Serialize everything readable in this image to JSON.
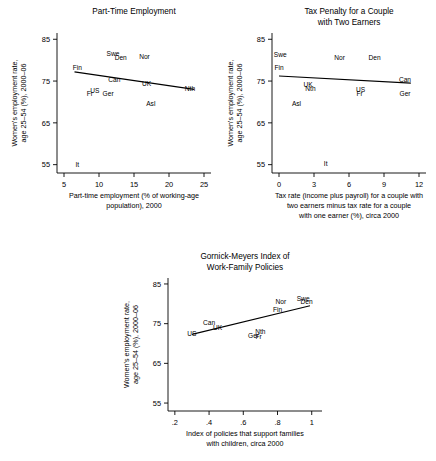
{
  "figure": {
    "shared_ylabel_line1": "Women's employment rate,",
    "shared_ylabel_line2": "age 25–54 (%), 2000–06"
  },
  "chart_data": [
    {
      "id": "part-time-employment",
      "type": "scatter",
      "title_lines": [
        "Part-Time Employment"
      ],
      "xlabel_lines": [
        "Part-time employment (% of working-age",
        "population), 2000"
      ],
      "ylabel_lines": [
        "Women's employment rate,",
        "age 25–54 (%), 2000–06"
      ],
      "xlim": [
        4.0,
        26.0
      ],
      "ylim": [
        53.0,
        86.5
      ],
      "xticks": [
        5,
        10,
        15,
        20,
        25
      ],
      "xticklabels": [
        "5",
        "10",
        "15",
        "20",
        "25"
      ],
      "yticks": [
        55,
        65,
        75,
        85
      ],
      "yticklabels": [
        "55",
        "65",
        "75",
        "85"
      ],
      "grid": false,
      "legend": "none",
      "points": [
        {
          "label": "Fin",
          "x": 6.9,
          "y": 78.3
        },
        {
          "label": "Swe",
          "x": 12.0,
          "y": 81.5
        },
        {
          "label": "Den",
          "x": 13.1,
          "y": 80.6
        },
        {
          "label": "Nor",
          "x": 16.5,
          "y": 80.8
        },
        {
          "label": "Can",
          "x": 12.2,
          "y": 75.4
        },
        {
          "label": "UK",
          "x": 16.8,
          "y": 74.3
        },
        {
          "label": "Nth",
          "x": 23.0,
          "y": 73.1
        },
        {
          "label": "US",
          "x": 9.4,
          "y": 72.7
        },
        {
          "label": "Fr",
          "x": 8.7,
          "y": 71.9
        },
        {
          "label": "Ger",
          "x": 11.3,
          "y": 72.0
        },
        {
          "label": "Asl",
          "x": 17.4,
          "y": 69.6
        },
        {
          "label": "It",
          "x": 6.9,
          "y": 55.1
        }
      ],
      "fitline": {
        "x1": 6.5,
        "y1": 77.2,
        "x2": 23.6,
        "y2": 73.0
      }
    },
    {
      "id": "tax-penalty-two-earners",
      "type": "scatter",
      "title_lines": [
        "Tax Penalty for a Couple",
        "with Two Earners"
      ],
      "xlabel_lines": [
        "Tax rate (income plus payroll) for a couple with",
        "two earners minus tax rate for a couple",
        "with one earner (%), circa 2000"
      ],
      "ylabel_lines": [
        "Women's employment rate,",
        "age 25–54 (%), 2000–06"
      ],
      "xlim": [
        -0.6,
        12.6
      ],
      "ylim": [
        53.0,
        86.5
      ],
      "xticks": [
        0,
        3,
        6,
        9,
        12
      ],
      "xticklabels": [
        "0",
        "3",
        "6",
        "9",
        "12"
      ],
      "yticks": [
        55,
        65,
        75,
        85
      ],
      "yticklabels": [
        "55",
        "65",
        "75",
        "85"
      ],
      "grid": false,
      "legend": "none",
      "points": [
        {
          "label": "Swe",
          "x": 0.1,
          "y": 81.4
        },
        {
          "label": "Fin",
          "x": 0.0,
          "y": 78.3
        },
        {
          "label": "Nor",
          "x": 5.2,
          "y": 80.6
        },
        {
          "label": "Den",
          "x": 8.2,
          "y": 80.7
        },
        {
          "label": "Can",
          "x": 10.8,
          "y": 75.4
        },
        {
          "label": "UK",
          "x": 2.5,
          "y": 74.1
        },
        {
          "label": "Nth",
          "x": 2.7,
          "y": 73.1
        },
        {
          "label": "US",
          "x": 7.0,
          "y": 73.0
        },
        {
          "label": "Fr",
          "x": 6.9,
          "y": 71.9
        },
        {
          "label": "Ger",
          "x": 10.8,
          "y": 72.0
        },
        {
          "label": "Asl",
          "x": 1.5,
          "y": 69.5
        },
        {
          "label": "It",
          "x": 4.0,
          "y": 55.2
        }
      ],
      "fitline": {
        "x1": 0.0,
        "y1": 76.2,
        "x2": 11.3,
        "y2": 74.5
      }
    },
    {
      "id": "gornick-meyers-index",
      "type": "scatter",
      "title_lines": [
        "Gornick-Meyers Index of",
        "Work-Family Policies"
      ],
      "xlabel_lines": [
        "Index of policies that support families",
        "with children, circa 2000"
      ],
      "ylabel_lines": [
        "Women's employment rate,",
        "age 25–54 (%), 2000–06"
      ],
      "xlim": [
        0.16,
        1.06
      ],
      "ylim": [
        53.0,
        86.5
      ],
      "xticks": [
        0.2,
        0.4,
        0.6,
        0.8,
        1.0
      ],
      "xticklabels": [
        ".2",
        ".4",
        ".6",
        ".8",
        "1"
      ],
      "yticks": [
        55,
        65,
        75,
        85
      ],
      "yticklabels": [
        "55",
        "65",
        "75",
        "85"
      ],
      "grid": false,
      "legend": "none",
      "points": [
        {
          "label": "US",
          "x": 0.3,
          "y": 72.5
        },
        {
          "label": "Can",
          "x": 0.4,
          "y": 75.2
        },
        {
          "label": "UK",
          "x": 0.45,
          "y": 74.0
        },
        {
          "label": "Ger",
          "x": 0.66,
          "y": 72.0
        },
        {
          "label": "Fr",
          "x": 0.69,
          "y": 71.8
        },
        {
          "label": "Nth",
          "x": 0.7,
          "y": 73.0
        },
        {
          "label": "Fin",
          "x": 0.8,
          "y": 78.5
        },
        {
          "label": "Nor",
          "x": 0.82,
          "y": 80.5
        },
        {
          "label": "Swe",
          "x": 0.95,
          "y": 81.4
        },
        {
          "label": "Den",
          "x": 0.97,
          "y": 80.5
        }
      ],
      "fitline": {
        "x1": 0.3,
        "y1": 72.3,
        "x2": 0.99,
        "y2": 79.5
      }
    }
  ]
}
